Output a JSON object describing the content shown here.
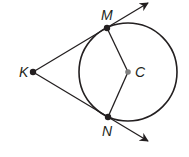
{
  "diagram": {
    "type": "geometry-tangent-lines",
    "colors": {
      "stroke": "#231f20",
      "center_point": "#808080",
      "background": "#ffffff"
    },
    "circle": {
      "center_label": "C",
      "cx": 128,
      "cy": 72,
      "r": 49
    },
    "points": {
      "K": {
        "label": "K",
        "x": 33,
        "y": 72
      },
      "M": {
        "label": "M",
        "x": 107,
        "y": 28
      },
      "N": {
        "label": "N",
        "x": 108,
        "y": 117
      },
      "C": {
        "label": "C",
        "x": 128,
        "y": 72
      }
    },
    "rays": [
      {
        "name": "ray-KM",
        "from": "K",
        "through": "M",
        "arrow_end": [
          148,
          3
        ]
      },
      {
        "name": "ray-KN",
        "from": "K",
        "through": "N",
        "arrow_end": [
          148,
          141
        ]
      }
    ],
    "segments": [
      {
        "name": "radius-CM",
        "from": "C",
        "to": "M"
      },
      {
        "name": "radius-CN",
        "from": "C",
        "to": "N"
      }
    ]
  }
}
